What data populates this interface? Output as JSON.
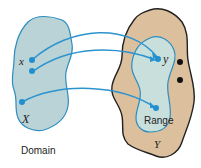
{
  "diagram": {
    "domain_set": {
      "label": "Domain",
      "set_name": "X",
      "element_label": "x",
      "fill": "#b9d3d6",
      "stroke": "#2d8dbf"
    },
    "codomain_set": {
      "set_name": "Y",
      "element_label": "y",
      "fill": "#dcbf9c",
      "stroke": "#222222"
    },
    "range_set": {
      "label": "Range",
      "fill": "#c9dfdc",
      "stroke": "#2d8dbf"
    },
    "arrow_color": "#2b93cf",
    "mappings": [
      {
        "from": "x point 1",
        "to": "y"
      },
      {
        "from": "x point 2",
        "to": "y"
      },
      {
        "from": "domain point 3",
        "to": "range point"
      }
    ],
    "unmapped_points_in_Y": 2
  }
}
